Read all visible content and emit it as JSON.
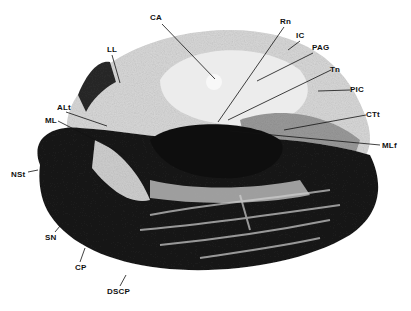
{
  "figure": {
    "type": "histology-cross-section",
    "colors": {
      "background": "#ffffff",
      "dark_tissue": "#151515",
      "light_tissue": "#dcdcdc",
      "mid_tissue": "#8a8a8a",
      "label": "#111111"
    },
    "labels": [
      {
        "id": "CA",
        "text": "CA",
        "x": 150,
        "y": 14
      },
      {
        "id": "Rn",
        "text": "Rn",
        "x": 280,
        "y": 18
      },
      {
        "id": "IC",
        "text": "IC",
        "x": 296,
        "y": 32
      },
      {
        "id": "PAG",
        "text": "PAG",
        "x": 312,
        "y": 44
      },
      {
        "id": "Tn",
        "text": "Tn",
        "x": 330,
        "y": 66
      },
      {
        "id": "PIC",
        "text": "PIC",
        "x": 350,
        "y": 86
      },
      {
        "id": "CTt",
        "text": "CTt",
        "x": 366,
        "y": 111
      },
      {
        "id": "MLf",
        "text": "MLf",
        "x": 382,
        "y": 142
      },
      {
        "id": "LL",
        "text": "LL",
        "x": 107,
        "y": 46
      },
      {
        "id": "ALt",
        "text": "ALt",
        "x": 57,
        "y": 104
      },
      {
        "id": "ML",
        "text": "ML",
        "x": 45,
        "y": 117
      },
      {
        "id": "NSt",
        "text": "NSt",
        "x": 11,
        "y": 171
      },
      {
        "id": "SN",
        "text": "SN",
        "x": 45,
        "y": 234
      },
      {
        "id": "CP",
        "text": "CP",
        "x": 75,
        "y": 264
      },
      {
        "id": "DSCP",
        "text": "DSCP",
        "x": 107,
        "y": 288
      }
    ]
  }
}
